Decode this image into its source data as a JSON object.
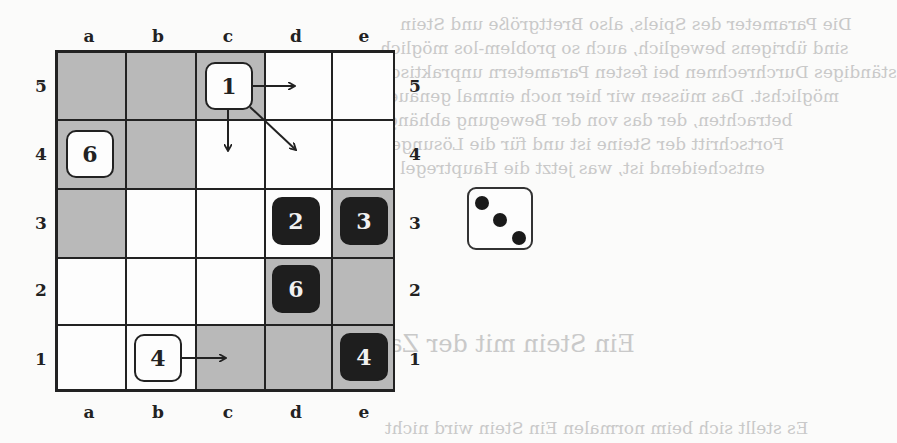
{
  "background_text": {
    "lines": [
      {
        "text": "Die Parameter des Spiels, also Brettgröße und Stein",
        "x": 400,
        "y": 14
      },
      {
        "text": "sind übrigens beweglich, auch so problem-los möglich",
        "x": 380,
        "y": 38
      },
      {
        "text": "ständiges Durchrechnen bei festen Parametern unpraktisch",
        "x": 380,
        "y": 62
      },
      {
        "text": "möglichst. Das müssen wir hier noch einmal genauer",
        "x": 380,
        "y": 86
      },
      {
        "text": "betrachten, der das von der Bewegung abhängt",
        "x": 380,
        "y": 110
      },
      {
        "text": "Fortschritt der Steine ist und für die Lösungen",
        "x": 380,
        "y": 134
      },
      {
        "text": "entscheidend ist, was jetzt die Hauptregel",
        "x": 400,
        "y": 158
      },
      {
        "text": "Ein Stein mit der Zahl",
        "x": 365,
        "y": 340,
        "heading": true
      },
      {
        "text": "Es stellt sich beim normalen Ein Stein wird nicht",
        "x": 385,
        "y": 424
      }
    ]
  },
  "board": {
    "columns": [
      "a",
      "b",
      "c",
      "d",
      "e"
    ],
    "rows": [
      "5",
      "4",
      "3",
      "2",
      "1"
    ],
    "shading": [
      [
        "gray",
        "gray",
        "gray",
        "white",
        "white"
      ],
      [
        "gray",
        "gray",
        "white",
        "white",
        "white"
      ],
      [
        "gray",
        "white",
        "white",
        "white",
        "gray"
      ],
      [
        "white",
        "white",
        "white",
        "gray",
        "gray"
      ],
      [
        "white",
        "white",
        "gray",
        "gray",
        "gray"
      ]
    ],
    "pieces": [
      {
        "square": "c5",
        "value": "1",
        "color": "light"
      },
      {
        "square": "a4",
        "value": "6",
        "color": "light"
      },
      {
        "square": "b1",
        "value": "4",
        "color": "light"
      },
      {
        "square": "d3",
        "value": "2",
        "color": "dark"
      },
      {
        "square": "e3",
        "value": "3",
        "color": "dark"
      },
      {
        "square": "d2",
        "value": "6",
        "color": "dark"
      },
      {
        "square": "e1",
        "value": "4",
        "color": "dark"
      }
    ],
    "moves": [
      {
        "from": "c5",
        "to": "d5",
        "direction": "right"
      },
      {
        "from": "c5",
        "to": "c4",
        "direction": "down"
      },
      {
        "from": "c5",
        "to": "d4",
        "direction": "down-right"
      },
      {
        "from": "b1",
        "to": "c1",
        "direction": "right"
      }
    ]
  },
  "die": {
    "value": 3,
    "icon": "die-face-three-icon"
  },
  "colors": {
    "gray_square": "#b9b9b9",
    "white_square": "#fdfdfd",
    "dark_piece": "#1e1e1e",
    "light_piece": "#fdfdfd",
    "grid_line": "#222222"
  }
}
